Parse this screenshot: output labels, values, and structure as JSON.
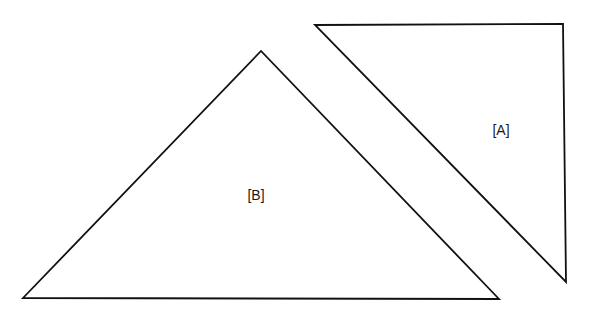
{
  "diagram": {
    "background": "#ffffff",
    "stroke_color": "#111111",
    "shapes": [
      {
        "id": "B",
        "type": "triangle",
        "label": "[B]",
        "points": [
          [
            23,
            298
          ],
          [
            261,
            51
          ],
          [
            499,
            299
          ]
        ],
        "label_pos": [
          256,
          200
        ]
      },
      {
        "id": "A",
        "type": "right-triangle",
        "label": "[A]",
        "points": [
          [
            315,
            25
          ],
          [
            563,
            24
          ],
          [
            566,
            282
          ]
        ],
        "label_pos": [
          501,
          135
        ]
      }
    ]
  }
}
